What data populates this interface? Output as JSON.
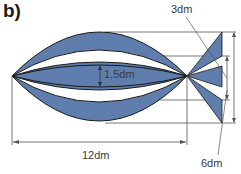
{
  "figure": {
    "part_label": "b)",
    "fill_color": "#5f7eae",
    "outline_color": "#1a1a1a",
    "dimension_line_color": "#555555"
  },
  "dimensions": {
    "body_length": "12dm",
    "inner_gap": "1,5dm",
    "tail_inner_height": "3dm",
    "tail_outer_height": "6dm"
  }
}
